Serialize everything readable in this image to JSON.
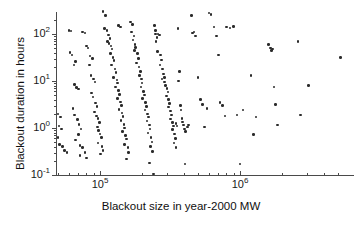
{
  "chart_data": {
    "type": "scatter",
    "title": "",
    "xlabel": "Blackout size in year-2000 MW",
    "ylabel": "Blackout duration in hours",
    "xscale": "log",
    "yscale": "log",
    "xlim": [
      40000,
      6000000
    ],
    "ylim": [
      0.1,
      400
    ],
    "grid": false,
    "legend": null,
    "marker": {
      "shape": "circle",
      "color": "#2b2b2b",
      "size_px": 2.6
    },
    "x_ticks": [
      {
        "value": 100000,
        "label_mantissa": "10",
        "label_exponent": "5",
        "major": true
      },
      {
        "value": 1000000,
        "label_mantissa": "10",
        "label_exponent": "6",
        "major": true
      }
    ],
    "x_minor_ticks": [
      50000,
      60000,
      70000,
      80000,
      90000,
      200000,
      300000,
      400000,
      500000,
      600000,
      700000,
      800000,
      900000,
      2000000,
      3000000,
      4000000,
      5000000
    ],
    "y_ticks": [
      {
        "value": 0.1,
        "label_mantissa": "10",
        "label_exponent": "-1",
        "major": true
      },
      {
        "value": 1,
        "label_mantissa": "10",
        "label_exponent": "0",
        "major": true
      },
      {
        "value": 10,
        "label_mantissa": "10",
        "label_exponent": "1",
        "major": true
      },
      {
        "value": 100,
        "label_mantissa": "10",
        "label_exponent": "2",
        "major": true
      }
    ],
    "y_minor_ticks": [
      0.2,
      0.3,
      0.4,
      0.5,
      0.6,
      0.7,
      0.8,
      0.9,
      2,
      3,
      4,
      5,
      6,
      7,
      8,
      9,
      20,
      30,
      40,
      50,
      60,
      70,
      80,
      90,
      200,
      300
    ],
    "points": [
      [
        44000,
        200
      ],
      [
        45000,
        190
      ],
      [
        44500,
        60
      ],
      [
        45000,
        55
      ],
      [
        44500,
        50
      ],
      [
        45500,
        48
      ],
      [
        44000,
        45
      ],
      [
        46000,
        52
      ],
      [
        45000,
        6.0
      ],
      [
        44500,
        5.6
      ],
      [
        45000,
        3.0
      ],
      [
        46000,
        0.52
      ],
      [
        45500,
        0.48
      ],
      [
        47000,
        30
      ],
      [
        50000,
        2.0
      ],
      [
        52000,
        1.7
      ],
      [
        51000,
        1.1
      ],
      [
        53000,
        0.95
      ],
      [
        50000,
        0.62
      ],
      [
        51500,
        0.45
      ],
      [
        54000,
        0.4
      ],
      [
        56000,
        0.33
      ],
      [
        58000,
        0.3
      ],
      [
        60000,
        120
      ],
      [
        62000,
        115
      ],
      [
        61000,
        40
      ],
      [
        63000,
        36
      ],
      [
        65000,
        22
      ],
      [
        67000,
        26
      ],
      [
        66000,
        8.5
      ],
      [
        68000,
        7.2
      ],
      [
        70000,
        6.8
      ],
      [
        64000,
        2.6
      ],
      [
        66000,
        1.9
      ],
      [
        69000,
        1.5
      ],
      [
        71000,
        1.2
      ],
      [
        73000,
        0.95
      ],
      [
        70000,
        0.72
      ],
      [
        67000,
        0.55
      ],
      [
        72000,
        0.42
      ],
      [
        75000,
        0.38
      ],
      [
        78000,
        0.3
      ],
      [
        80000,
        0.23
      ],
      [
        72000,
        0.26
      ],
      [
        75000,
        110
      ],
      [
        78000,
        105
      ],
      [
        80000,
        55
      ],
      [
        82000,
        50
      ],
      [
        85000,
        34
      ],
      [
        88000,
        30
      ],
      [
        84000,
        22
      ],
      [
        86000,
        13
      ],
      [
        90000,
        11
      ],
      [
        92000,
        9.5
      ],
      [
        87000,
        5.5
      ],
      [
        89000,
        4.6
      ],
      [
        93000,
        3.4
      ],
      [
        95000,
        2.9
      ],
      [
        91000,
        2.2
      ],
      [
        94000,
        1.8
      ],
      [
        97000,
        1.6
      ],
      [
        99000,
        1.3
      ],
      [
        96000,
        1.05
      ],
      [
        98000,
        0.88
      ],
      [
        100000,
        0.74
      ],
      [
        102000,
        0.62
      ],
      [
        97000,
        0.48
      ],
      [
        103000,
        0.4
      ],
      [
        105000,
        0.33
      ],
      [
        101000,
        0.28
      ],
      [
        105000,
        300
      ],
      [
        110000,
        250
      ],
      [
        108000,
        130
      ],
      [
        112000,
        120
      ],
      [
        115000,
        95
      ],
      [
        118000,
        80
      ],
      [
        113000,
        70
      ],
      [
        116000,
        62
      ],
      [
        120000,
        56
      ],
      [
        122000,
        48
      ],
      [
        119000,
        38
      ],
      [
        124000,
        32
      ],
      [
        126000,
        27
      ],
      [
        121000,
        22
      ],
      [
        128000,
        18
      ],
      [
        130000,
        15
      ],
      [
        125000,
        12
      ],
      [
        132000,
        10.5
      ],
      [
        134000,
        9.0
      ],
      [
        129000,
        7.5
      ],
      [
        136000,
        6.2
      ],
      [
        138000,
        5.2
      ],
      [
        133000,
        4.3
      ],
      [
        140000,
        3.6
      ],
      [
        142000,
        3.0
      ],
      [
        137000,
        2.5
      ],
      [
        144000,
        2.1
      ],
      [
        146000,
        1.75
      ],
      [
        141000,
        1.45
      ],
      [
        148000,
        1.2
      ],
      [
        150000,
        1.0
      ],
      [
        145000,
        0.85
      ],
      [
        152000,
        0.7
      ],
      [
        155000,
        0.58
      ],
      [
        149000,
        0.45
      ],
      [
        158000,
        0.38
      ],
      [
        160000,
        0.3
      ],
      [
        154000,
        0.22
      ],
      [
        130000,
        350
      ],
      [
        135000,
        150
      ],
      [
        140000,
        140
      ],
      [
        165000,
        180
      ],
      [
        170000,
        160
      ],
      [
        168000,
        110
      ],
      [
        175000,
        90
      ],
      [
        172000,
        75
      ],
      [
        178000,
        60
      ],
      [
        180000,
        52
      ],
      [
        176000,
        44
      ],
      [
        185000,
        38
      ],
      [
        188000,
        30
      ],
      [
        182000,
        24
      ],
      [
        190000,
        20
      ],
      [
        195000,
        16
      ],
      [
        192000,
        13
      ],
      [
        198000,
        11
      ],
      [
        200000,
        9.0
      ],
      [
        196000,
        7.5
      ],
      [
        205000,
        6.0
      ],
      [
        208000,
        5.0
      ],
      [
        202000,
        4.2
      ],
      [
        212000,
        3.5
      ],
      [
        215000,
        2.9
      ],
      [
        210000,
        2.4
      ],
      [
        218000,
        2.0
      ],
      [
        222000,
        1.7
      ],
      [
        216000,
        1.4
      ],
      [
        225000,
        1.15
      ],
      [
        228000,
        0.95
      ],
      [
        220000,
        0.78
      ],
      [
        232000,
        0.62
      ],
      [
        235000,
        0.5
      ],
      [
        230000,
        0.4
      ],
      [
        238000,
        0.32
      ],
      [
        226000,
        0.18
      ],
      [
        240000,
        0.105
      ],
      [
        245000,
        150
      ],
      [
        250000,
        120
      ],
      [
        248000,
        100
      ],
      [
        255000,
        85
      ],
      [
        252000,
        70
      ],
      [
        260000,
        100
      ],
      [
        265000,
        95
      ],
      [
        258000,
        42
      ],
      [
        270000,
        36
      ],
      [
        275000,
        28
      ],
      [
        268000,
        22
      ],
      [
        280000,
        18
      ],
      [
        285000,
        14
      ],
      [
        278000,
        11
      ],
      [
        290000,
        9.5
      ],
      [
        295000,
        8.0
      ],
      [
        288000,
        12
      ],
      [
        300000,
        7.0
      ],
      [
        305000,
        5.8
      ],
      [
        298000,
        4.8
      ],
      [
        310000,
        4.0
      ],
      [
        315000,
        3.3
      ],
      [
        308000,
        2.8
      ],
      [
        320000,
        2.3
      ],
      [
        325000,
        1.9
      ],
      [
        318000,
        1.55
      ],
      [
        330000,
        1.3
      ],
      [
        335000,
        1.1
      ],
      [
        328000,
        0.92
      ],
      [
        340000,
        0.75
      ],
      [
        345000,
        0.6
      ],
      [
        338000,
        0.48
      ],
      [
        350000,
        0.38
      ],
      [
        348000,
        1.25
      ],
      [
        355000,
        1.1
      ],
      [
        360000,
        130
      ],
      [
        370000,
        16
      ],
      [
        365000,
        10
      ],
      [
        375000,
        3.0
      ],
      [
        380000,
        2.4
      ],
      [
        385000,
        1.6
      ],
      [
        390000,
        1.35
      ],
      [
        395000,
        1.15
      ],
      [
        400000,
        0.95
      ],
      [
        410000,
        0.85
      ],
      [
        420000,
        1.05
      ],
      [
        430000,
        1.15
      ],
      [
        405000,
        0.17
      ],
      [
        450000,
        250
      ],
      [
        470000,
        110
      ],
      [
        460000,
        105
      ],
      [
        480000,
        90
      ],
      [
        500000,
        12
      ],
      [
        520000,
        4.0
      ],
      [
        540000,
        3.2
      ],
      [
        560000,
        1.05
      ],
      [
        580000,
        2.6
      ],
      [
        600000,
        280
      ],
      [
        620000,
        260
      ],
      [
        650000,
        140
      ],
      [
        680000,
        90
      ],
      [
        700000,
        36
      ],
      [
        720000,
        3.5
      ],
      [
        750000,
        3.0
      ],
      [
        780000,
        1.8
      ],
      [
        800000,
        140
      ],
      [
        850000,
        135
      ],
      [
        900000,
        145
      ],
      [
        950000,
        1.9
      ],
      [
        1000000,
        0.17
      ],
      [
        1050000,
        2.4
      ],
      [
        1200000,
        13
      ],
      [
        1250000,
        0.72
      ],
      [
        1300000,
        1.7
      ],
      [
        1600000,
        60
      ],
      [
        1650000,
        50
      ],
      [
        1700000,
        48
      ],
      [
        1680000,
        45
      ],
      [
        1750000,
        7.5
      ],
      [
        1800000,
        3.2
      ],
      [
        1850000,
        1.15
      ],
      [
        2600000,
        70
      ],
      [
        2700000,
        1.9
      ],
      [
        3100000,
        8.0
      ],
      [
        5200000,
        32
      ]
    ]
  },
  "axis_titles": {
    "x": "Blackout size in year-2000 MW",
    "y": "Blackout duration in hours"
  },
  "colors": {
    "marker": "#2b2b2b",
    "axis": "#4a4a4a",
    "text": "#101010",
    "background": "#ffffff"
  }
}
